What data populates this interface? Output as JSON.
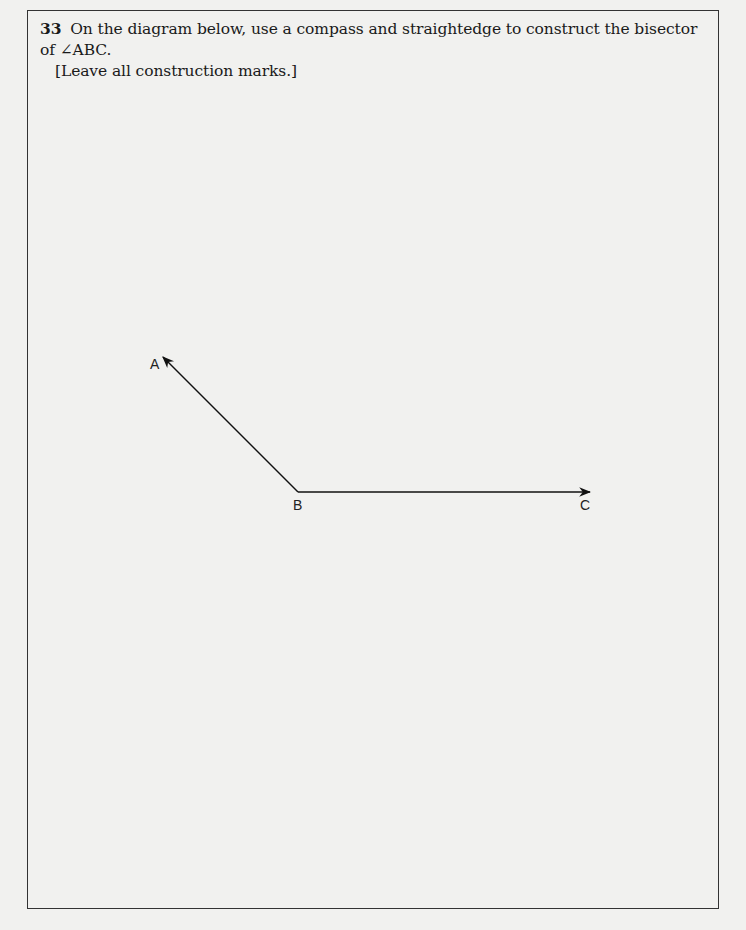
{
  "question": {
    "number": "33",
    "text": "On the diagram below, use a compass and straightedge to construct the bisector of ∠ABC.",
    "instruction": "[Leave all construction marks.]"
  },
  "diagram": {
    "points": {
      "A": {
        "label": "A",
        "x": 163,
        "y": 356
      },
      "B": {
        "label": "B",
        "x": 298,
        "y": 492
      },
      "C": {
        "label": "C",
        "x": 590,
        "y": 492
      }
    },
    "rays": [
      "BA",
      "BC"
    ]
  }
}
